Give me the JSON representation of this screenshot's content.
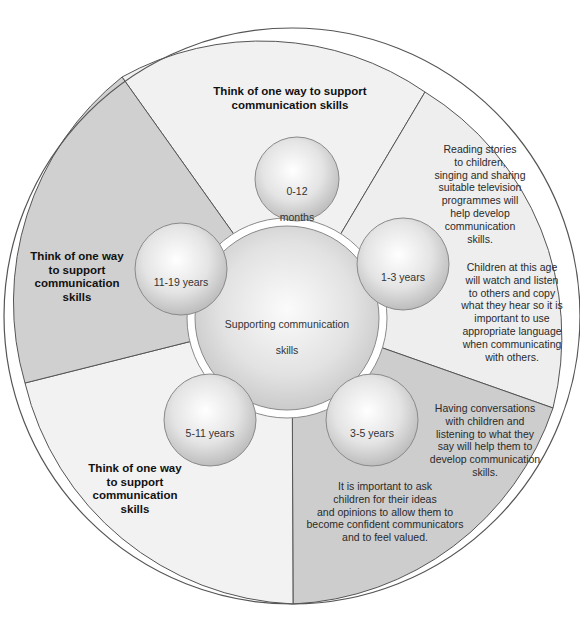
{
  "diagram": {
    "center": {
      "label_line1": "Supporting communication",
      "label_line2": "skills"
    },
    "age_bubbles": [
      {
        "label_line1": "0-12",
        "label_line2": "months"
      },
      {
        "label_line1": "1-3 years",
        "label_line2": ""
      },
      {
        "label_line1": "3-5 years",
        "label_line2": ""
      },
      {
        "label_line1": "5-11 years",
        "label_line2": ""
      },
      {
        "label_line1": "11-19 years",
        "label_line2": ""
      }
    ],
    "segments": {
      "top": {
        "lines": [
          "Think of one way to support",
          "communication skills"
        ]
      },
      "right_upper": {
        "paragraph1": [
          "Reading stories",
          "to children,",
          "singing and sharing",
          "suitable television",
          "programmes will",
          "help develop",
          "communication",
          "skills."
        ],
        "paragraph2": [
          "Children at this age",
          "will watch and listen",
          "to others and copy",
          "what they hear so it is",
          "important to use",
          "appropriate language",
          "when communicating",
          "with others."
        ]
      },
      "right_lower": {
        "paragraph1": [
          "Having conversations",
          "with children and",
          "listening to what they",
          "say will help them to",
          "develop communication",
          "skills."
        ],
        "paragraph2": [
          "It is important to ask",
          "children for their ideas",
          "and opinions to allow them to",
          "become confident communicators",
          "and to feel valued."
        ]
      },
      "left_upper": {
        "lines": [
          "Think of one way",
          "to support",
          "communication",
          "skills"
        ]
      },
      "left_lower": {
        "lines": [
          "Think of one way",
          "to support",
          "communication",
          "skills"
        ]
      }
    },
    "colors": {
      "light_segment": "#f0f0f0",
      "dark_segment": "#cfcfcf",
      "outline": "#555555",
      "bubble_edge": "#8a8a8a"
    }
  }
}
